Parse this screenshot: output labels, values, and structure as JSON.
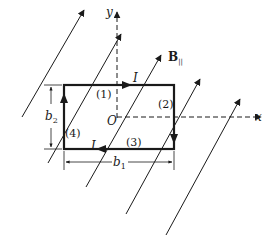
{
  "diagram": {
    "type": "physics-current-loop-in-magnetic-field",
    "colors": {
      "stroke": "#1a1a1a",
      "background": "#ffffff"
    },
    "axes": {
      "x_label": "x",
      "y_label": "y",
      "origin_label": "O"
    },
    "field": {
      "label": "B",
      "subscript": "||",
      "line_count": 6
    },
    "loop": {
      "current_label": "I",
      "segments": [
        {
          "id": 1,
          "label": "(1)",
          "side": "top",
          "direction": "right"
        },
        {
          "id": 2,
          "label": "(2)",
          "side": "right",
          "direction": "down"
        },
        {
          "id": 3,
          "label": "(3)",
          "side": "bottom",
          "direction": "left"
        },
        {
          "id": 4,
          "label": "(4)",
          "side": "left",
          "direction": "up"
        }
      ]
    },
    "dimensions": {
      "width_label": "b",
      "width_subscript": "1",
      "height_label": "b",
      "height_subscript": "2"
    }
  }
}
